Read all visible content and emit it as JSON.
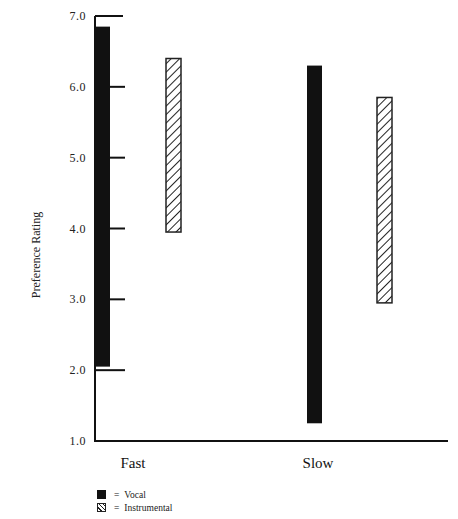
{
  "chart_data": {
    "type": "bar",
    "subtype": "floating-range-bar",
    "title": "",
    "xlabel": "",
    "ylabel": "Preference Rating",
    "ylim": [
      1.0,
      7.0
    ],
    "yticks": [
      "1.0",
      "2.0",
      "3.0",
      "4.0",
      "5.0",
      "6.0",
      "7.0"
    ],
    "grid": false,
    "legend_position": "bottom-left",
    "categories": [
      "Fast",
      "Slow"
    ],
    "series": [
      {
        "name": "Vocal",
        "fill": "solid",
        "color": "#111111",
        "ranges": [
          {
            "category": "Fast",
            "low": 2.05,
            "high": 6.85
          },
          {
            "category": "Slow",
            "low": 1.25,
            "high": 6.3
          }
        ]
      },
      {
        "name": "Instrumental",
        "fill": "hatched",
        "color": "#222222",
        "ranges": [
          {
            "category": "Fast",
            "low": 3.95,
            "high": 6.4
          },
          {
            "category": "Slow",
            "low": 2.95,
            "high": 5.85
          }
        ]
      }
    ]
  },
  "legend": {
    "items": [
      {
        "equals": "=",
        "label": "Vocal"
      },
      {
        "equals": "=",
        "label": "Instrumental"
      }
    ]
  }
}
